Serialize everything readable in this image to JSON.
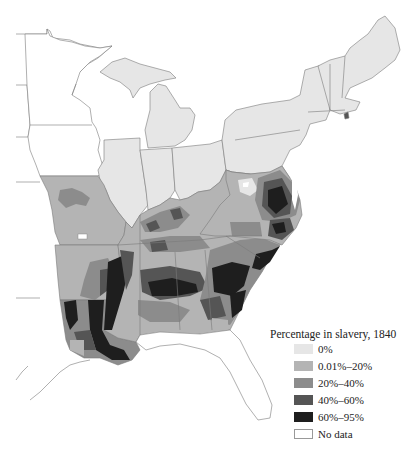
{
  "map": {
    "subject": "Eastern United States counties shaded by percentage of population in slavery, 1840",
    "colors": {
      "c0": "#e6e6e6",
      "c1": "#b4b4b4",
      "c2": "#8c8c8c",
      "c3": "#555555",
      "c4": "#1e1e1e",
      "nodata": "#ffffff",
      "border": "#7a7a7a"
    }
  },
  "legend": {
    "title": "Percentage in slavery, 1840",
    "items": [
      {
        "label": "0%",
        "color": "#e6e6e6"
      },
      {
        "label": "0.01%–20%",
        "color": "#b4b4b4"
      },
      {
        "label": "20%–40%",
        "color": "#8c8c8c"
      },
      {
        "label": "40%–60%",
        "color": "#555555"
      },
      {
        "label": "60%–95%",
        "color": "#1e1e1e"
      },
      {
        "label": "No data",
        "color": "#ffffff"
      }
    ]
  }
}
